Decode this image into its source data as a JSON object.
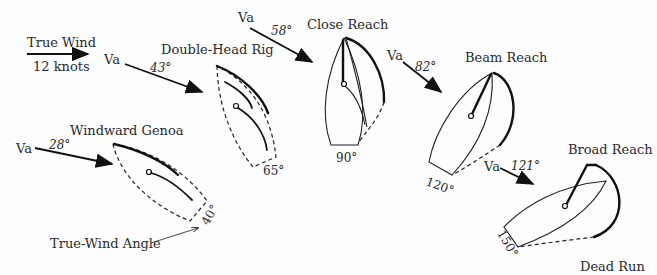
{
  "true_wind": {
    "label": "True Wind",
    "speed": "12 knots"
  },
  "apparent_wind_label": "Va",
  "true_wind_angle_label": "True-Wind Angle",
  "points_of_sail": [
    {
      "name": "Windward Genoa",
      "apparent_angle": "28°",
      "true_angle": "40°"
    },
    {
      "name": "Double-Head Rig",
      "apparent_angle": "43°",
      "true_angle": "65°"
    },
    {
      "name": "Close Reach",
      "apparent_angle": "58°",
      "true_angle": "90°"
    },
    {
      "name": "Beam Reach",
      "apparent_angle": "82°",
      "true_angle": "120°"
    },
    {
      "name": "Broad Reach",
      "apparent_angle": "121°",
      "true_angle": "150°"
    },
    {
      "name": "Dead Run",
      "apparent_angle": "",
      "true_angle": ""
    }
  ]
}
